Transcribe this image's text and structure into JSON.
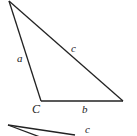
{
  "diagram": {
    "triangle1": {
      "vertices": {
        "top": [
          9,
          1
        ],
        "C": [
          41,
          101
        ],
        "right": [
          123,
          101
        ]
      },
      "labels": {
        "side_a": "a",
        "side_b": "b",
        "side_c": "c",
        "vertex_C": "C"
      }
    },
    "triangle2": {
      "labels": {
        "side_c": "c"
      }
    },
    "colors": {
      "stroke": "#222222",
      "background": "#ffffff"
    }
  }
}
